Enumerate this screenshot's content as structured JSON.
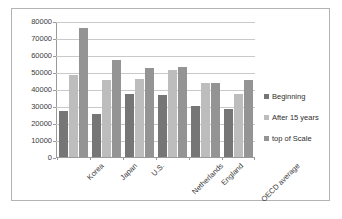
{
  "chart_data": {
    "type": "bar",
    "title": "",
    "subtitle": "",
    "xlabel": "",
    "ylabel": "",
    "categories": [
      "Korea",
      "Japan",
      "U.S.",
      "Netherlands",
      "England",
      "OECD average"
    ],
    "series": [
      {
        "name": "Beginning",
        "color": "#767676",
        "values": [
          27500,
          25500,
          37500,
          36500,
          30500,
          28500
        ]
      },
      {
        "name": "After 15 years",
        "color": "#bdbdbd",
        "values": [
          48500,
          45500,
          46000,
          51500,
          44000,
          37500
        ]
      },
      {
        "name": "top of Scale",
        "color": "#949494",
        "values": [
          76500,
          57500,
          53000,
          53500,
          44000,
          45500
        ]
      }
    ],
    "ylim": [
      0,
      80000
    ],
    "ytick_values": [
      80000,
      70000,
      60000,
      50000,
      40000,
      30000,
      20000,
      10000,
      0
    ],
    "ytick_labels": [
      "80000",
      "70000",
      "60000",
      "50000",
      "40000",
      "30000",
      "20000",
      "10000",
      "0"
    ],
    "grid": true,
    "grid_axis": "y",
    "legend_position": "right",
    "legend_entries": [
      "Beginning",
      "After 15 years",
      "top of Scale"
    ]
  }
}
